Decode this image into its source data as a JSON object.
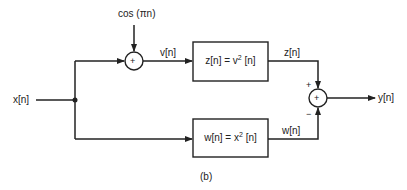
{
  "diagram": {
    "input_label": "x[n]",
    "modulation_label": "cos (πn)",
    "adder1": {
      "symbol": "+"
    },
    "v_label": "v[n]",
    "box_top": {
      "lhs": "z[n] = v",
      "exp": "2",
      "rhs": " [n]"
    },
    "z_label": "z[n]",
    "box_bottom": {
      "lhs": "w[n] = x",
      "exp": "2",
      "rhs": " [n]"
    },
    "w_label": "w[n]",
    "adder2": {
      "symbol": "+",
      "top_sign": "+",
      "bottom_sign": "−"
    },
    "output_label": "y[n]",
    "caption": "(b)"
  }
}
